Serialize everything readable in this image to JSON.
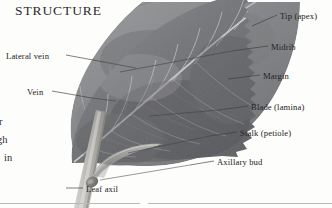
{
  "figure": {
    "title": "STRUCTURE"
  },
  "labels_right": [
    {
      "id": "tip",
      "text": "Tip (apex)",
      "x": 280,
      "y": 17,
      "line": {
        "x1": 277,
        "y1": 15,
        "x2": 252,
        "y2": 26
      }
    },
    {
      "id": "midrib",
      "text": "Midrib",
      "x": 271,
      "y": 48,
      "line": {
        "x1": 268,
        "y1": 46,
        "x2": 232,
        "y2": 51
      }
    },
    {
      "id": "margin",
      "text": "Margin",
      "x": 263,
      "y": 77,
      "line": {
        "x1": 260,
        "y1": 75,
        "x2": 228,
        "y2": 79
      }
    },
    {
      "id": "blade",
      "text": "Blade (lamina)",
      "x": 251,
      "y": 108,
      "line": {
        "x1": 248,
        "y1": 106,
        "x2": 219,
        "y2": 110
      }
    },
    {
      "id": "stalk",
      "text": "Stalk (petiole)",
      "x": 240,
      "y": 134,
      "line": {
        "x1": 237,
        "y1": 132,
        "x2": 210,
        "y2": 136
      }
    },
    {
      "id": "axillary-bud",
      "text": "Axillary bud",
      "x": 217,
      "y": 163,
      "line": {
        "x1": 214,
        "y1": 161,
        "x2": 190,
        "y2": 165
      }
    }
  ],
  "labels_left": [
    {
      "id": "lateral-vein",
      "text": "Lateral vein",
      "x": 6,
      "y": 57,
      "line": {
        "x1": 66,
        "y1": 55,
        "x2": 104,
        "y2": 62
      }
    },
    {
      "id": "vein",
      "text": "Vein",
      "x": 27,
      "y": 93,
      "line": {
        "x1": 52,
        "y1": 91,
        "x2": 92,
        "y2": 98
      }
    }
  ],
  "labels_bottom": [
    {
      "id": "leaf-axil",
      "text": "Leaf axil",
      "x": 86,
      "y": 190,
      "line": {
        "x1": 83,
        "y1": 188,
        "x2": 66,
        "y2": 188
      }
    }
  ],
  "bleed_text": [
    {
      "id": "frag-1",
      "text": "r",
      "x": -1,
      "y": 122
    },
    {
      "id": "frag-2",
      "text": "gh",
      "x": -3,
      "y": 140
    },
    {
      "id": "frag-3",
      "text": "in",
      "x": 4,
      "y": 158
    }
  ],
  "rules": [
    {
      "id": "footer-rule-left",
      "x": 0,
      "y": 203,
      "width": 140
    },
    {
      "id": "footer-rule-right",
      "x": 148,
      "y": 203,
      "width": 184
    }
  ],
  "colors": {
    "page_background": "#fdfdfc",
    "title_text": "#2b2b2b",
    "label_text": "#232323",
    "leader_line": "#3c3c3c",
    "rule": "#b9b9b9",
    "leaf_dark": "#6f7073",
    "leaf_mid": "#8d8e90",
    "leaf_light": "#a9aaac",
    "vein_light": "#c2c3c4",
    "stem_light": "#bdbcb8"
  }
}
